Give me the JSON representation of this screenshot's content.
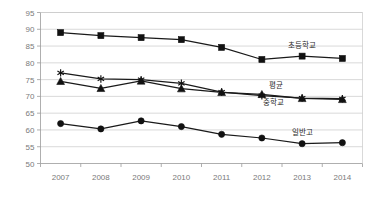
{
  "chart_data": {
    "type": "line",
    "title": "",
    "xlabel": "",
    "ylabel": "",
    "categories": [
      "2007",
      "2008",
      "2009",
      "2010",
      "2011",
      "2012",
      "2013",
      "2014"
    ],
    "x": [
      2007,
      2008,
      2009,
      2010,
      2011,
      2012,
      2013,
      2014
    ],
    "ylim": [
      50,
      95
    ],
    "yticks": [
      50,
      55,
      60,
      65,
      70,
      75,
      80,
      85,
      90,
      95
    ],
    "grid": true,
    "legend": "inline-labels",
    "series": [
      {
        "name": "초등학교",
        "marker": "square",
        "color": "#111111",
        "values": [
          89.0,
          88.1,
          87.5,
          86.9,
          84.6,
          81.0,
          82.0,
          81.3
        ],
        "label_x": 2013,
        "label_y": 84.3
      },
      {
        "name": "평균",
        "marker": "star",
        "color": "#111111",
        "values": [
          77.0,
          75.2,
          75.0,
          73.9,
          71.3,
          70.2,
          69.5,
          69.3
        ],
        "label_x": 2012.35,
        "label_y": 72.4
      },
      {
        "name": "중학교",
        "marker": "triangle",
        "color": "#111111",
        "values": [
          74.5,
          72.4,
          74.6,
          72.3,
          71.2,
          70.6,
          69.4,
          69.1
        ],
        "label_x": 2012.3,
        "label_y": 67.3
      },
      {
        "name": "일반고",
        "marker": "circle",
        "color": "#111111",
        "values": [
          61.9,
          60.3,
          62.7,
          61.0,
          58.7,
          57.6,
          55.9,
          56.2
        ],
        "label_x": 2013.0,
        "label_y": 58.4
      }
    ]
  },
  "colors": {
    "series": "#111111",
    "grid": "#c8c8c8",
    "axis": "#9a9a9a",
    "tick_text": "#7a7a7a",
    "label_text": "#2b2b2b",
    "background": "#ffffff"
  }
}
